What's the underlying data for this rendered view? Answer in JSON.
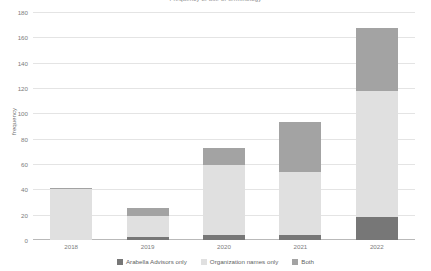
{
  "chart_data": {
    "type": "bar",
    "stacked": true,
    "title": "Frequency of use of terminology",
    "xlabel": "",
    "ylabel": "frequency",
    "categories": [
      "2018",
      "2019",
      "2020",
      "2021",
      "2022"
    ],
    "ylim": [
      0,
      180
    ],
    "yticks": [
      0,
      20,
      40,
      60,
      80,
      100,
      120,
      140,
      160,
      180
    ],
    "ytick_labels": [
      "0",
      "20",
      "40",
      "60",
      "80",
      "100",
      "120",
      "140",
      "160",
      "180"
    ],
    "grid": true,
    "legend_position": "bottom",
    "series": [
      {
        "name": "Arabella Advisors only",
        "color": "#777777",
        "values": [
          0,
          2,
          4,
          4,
          18
        ]
      },
      {
        "name": "Organization names only",
        "color": "#e0e0e0",
        "values": [
          40,
          17,
          55,
          50,
          100
        ]
      },
      {
        "name": "Both",
        "color": "#a3a3a3",
        "values": [
          1,
          6,
          14,
          39,
          49
        ]
      }
    ],
    "totals": [
      41,
      25,
      73,
      93,
      167
    ]
  }
}
